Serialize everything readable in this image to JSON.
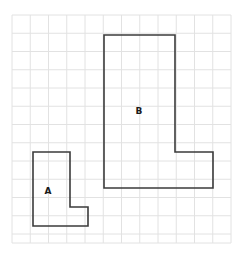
{
  "figure": {
    "type": "grid-polygon-figure",
    "background_color": "#ffffff",
    "canvas": {
      "width": 242,
      "height": 257
    },
    "grid": {
      "visible": true,
      "line_color": "#e2e2e2",
      "line_width": 1,
      "cell_size": 18.25,
      "origin_x": 12,
      "origin_y": 15,
      "columns": 12,
      "rows": 12.5,
      "x_lines": [
        12,
        30.25,
        48.5,
        66.75,
        85,
        103.25,
        121.5,
        139.75,
        158,
        176.25,
        194.5,
        212.75,
        231
      ],
      "y_lines": [
        15,
        33.25,
        51.5,
        69.75,
        88,
        106.25,
        124.5,
        142.75,
        161,
        179.25,
        197.5,
        215.75,
        234,
        243
      ]
    },
    "shapes": [
      {
        "id": "shape-a",
        "label": "A",
        "label_x": 48,
        "label_y": 191,
        "stroke_color": "#3b3b3b",
        "stroke_width": 1.6,
        "fill": "none",
        "points": "33,152 70,152 70,207 88,207 88,226 33,226",
        "grid_cells_wide": 3,
        "grid_cells_tall": 4
      },
      {
        "id": "shape-b",
        "label": "B",
        "label_x": 139,
        "label_y": 111,
        "stroke_color": "#3b3b3b",
        "stroke_width": 1.6,
        "fill": "none",
        "points": "104,35 175,35 175,152 213,152 213,188 104,188",
        "grid_cells_wide": 6,
        "grid_cells_tall": 8
      }
    ]
  }
}
